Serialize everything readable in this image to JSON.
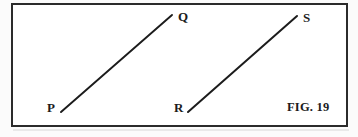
{
  "figure": {
    "caption": "FIG. 19",
    "background_color": "#ffffff",
    "page_color": "#fbfbfb",
    "ink_color": "#1c1c1c",
    "frame": {
      "name": "figure-border-rectangle",
      "x": 11,
      "y": 3,
      "width": 337,
      "height": 124,
      "stroke_color": "#2b2b2b",
      "stroke_width": 2.5
    },
    "labels": [
      {
        "id": "P",
        "text": "P",
        "x": 47,
        "y": 101
      },
      {
        "id": "Q",
        "text": "Q",
        "x": 178,
        "y": 10
      },
      {
        "id": "R",
        "text": "R",
        "x": 174,
        "y": 101
      },
      {
        "id": "S",
        "text": "S",
        "x": 303,
        "y": 11
      }
    ],
    "caption_position": {
      "x": 287,
      "y": 101
    }
  },
  "chart_data": {
    "type": "scatter",
    "title": "FIG. 19",
    "subtitle": "",
    "xlabel": "",
    "ylabel": "",
    "grid": false,
    "legend": "none",
    "xlim": [
      0,
      358
    ],
    "ylim": [
      137,
      0
    ],
    "annotations": [
      "P",
      "Q",
      "R",
      "S",
      "FIG. 19"
    ],
    "series": [
      {
        "name": "segment-PQ",
        "kind": "line-segment",
        "color": "#1c1c1c",
        "stroke_width": 1.9,
        "x": [
          61,
          172
        ],
        "y": [
          112,
          15
        ],
        "endpoints": [
          {
            "label": "P",
            "x": 61,
            "y": 112
          },
          {
            "label": "Q",
            "x": 172,
            "y": 15
          }
        ]
      },
      {
        "name": "segment-RS",
        "kind": "line-segment",
        "color": "#1c1c1c",
        "stroke_width": 2.0,
        "x": [
          188,
          297
        ],
        "y": [
          112,
          16
        ],
        "endpoints": [
          {
            "label": "R",
            "x": 188,
            "y": 112
          },
          {
            "label": "S",
            "x": 297,
            "y": 16
          }
        ]
      }
    ]
  }
}
